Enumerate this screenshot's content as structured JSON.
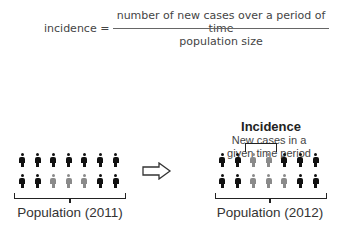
{
  "formula": {
    "lhs": "incidence =",
    "numerator": "number of new cases over a period of time",
    "denominator": "population size"
  },
  "left_panel": {
    "label": "Population (2011)",
    "rows": [
      [
        "black",
        "black",
        "black",
        "black",
        "black",
        "black",
        "black"
      ],
      [
        "black",
        "black",
        "gray",
        "gray",
        "gray",
        "black",
        "black"
      ]
    ]
  },
  "arrow": {
    "icon": "right-arrow-outline-icon"
  },
  "right_panel": {
    "title": "Incidence",
    "subtitle_line1": "New cases in a",
    "subtitle_line2": "given time period",
    "label": "Population (2012)",
    "rows": [
      [
        "black",
        "black",
        "gray",
        "gray",
        "black",
        "black",
        "black"
      ],
      [
        "black",
        "black",
        "gray",
        "gray",
        "gray",
        "black",
        "black"
      ]
    ]
  },
  "colors": {
    "black": "#111111",
    "gray": "#8a8a8a"
  }
}
